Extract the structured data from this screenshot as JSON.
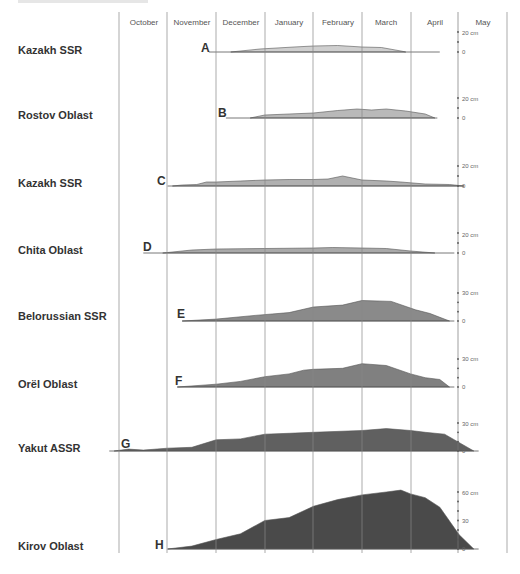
{
  "chart_data": {
    "type": "area",
    "title": "",
    "xlabel": "",
    "ylabel": "Snow depth",
    "months": [
      "October",
      "November",
      "December",
      "January",
      "February",
      "March",
      "April",
      "May"
    ],
    "axis_unit": "cm",
    "series": [
      {
        "id": "A",
        "region": "Kazakh SSR",
        "fill": "#cfcfcf",
        "scale_max": 20,
        "scale_label": "20 cm",
        "start_month_frac": 1.85,
        "end_month_frac": 6.6,
        "points": [
          [
            2.3,
            0
          ],
          [
            2.9,
            3
          ],
          [
            3.6,
            5
          ],
          [
            4.0,
            6
          ],
          [
            4.5,
            6.5
          ],
          [
            5.0,
            5
          ],
          [
            5.4,
            4.5
          ],
          [
            5.8,
            1
          ],
          [
            5.9,
            0
          ]
        ]
      },
      {
        "id": "B",
        "region": "Rostov Oblast",
        "fill": "#b9b9b9",
        "scale_max": 20,
        "scale_label": "20 cm",
        "start_month_frac": 2.2,
        "end_month_frac": 6.55,
        "points": [
          [
            2.7,
            0
          ],
          [
            3.0,
            3
          ],
          [
            3.5,
            4
          ],
          [
            4.0,
            5
          ],
          [
            4.5,
            7.5
          ],
          [
            4.9,
            9
          ],
          [
            5.2,
            8
          ],
          [
            5.5,
            9
          ],
          [
            5.9,
            7
          ],
          [
            6.3,
            4
          ],
          [
            6.5,
            0
          ]
        ]
      },
      {
        "id": "C",
        "region": "Kazakh SSR",
        "fill": "#b0b0b0",
        "scale_max": 20,
        "scale_label": "20 cm",
        "start_month_frac": 1.0,
        "end_month_frac": 7.1,
        "points": [
          [
            1.1,
            0
          ],
          [
            1.3,
            1
          ],
          [
            1.6,
            1.5
          ],
          [
            1.8,
            4
          ],
          [
            2.0,
            4
          ],
          [
            2.5,
            5
          ],
          [
            3.0,
            6
          ],
          [
            3.5,
            6.5
          ],
          [
            4.0,
            6.5
          ],
          [
            4.3,
            7
          ],
          [
            4.6,
            10
          ],
          [
            5.0,
            6
          ],
          [
            5.5,
            5
          ],
          [
            5.8,
            4
          ],
          [
            6.3,
            2
          ],
          [
            6.8,
            1.5
          ],
          [
            7.1,
            0
          ]
        ]
      },
      {
        "id": "D",
        "region": "Chita Oblast",
        "fill": "#a9a9a9",
        "scale_max": 20,
        "scale_label": "20 cm",
        "start_month_frac": 0.5,
        "end_month_frac": 6.9,
        "points": [
          [
            0.9,
            0
          ],
          [
            1.5,
            3
          ],
          [
            2.0,
            4
          ],
          [
            3.0,
            4.5
          ],
          [
            4.0,
            5
          ],
          [
            4.4,
            5.5
          ],
          [
            5.0,
            5
          ],
          [
            5.5,
            4.5
          ],
          [
            6.0,
            2
          ],
          [
            6.5,
            0
          ]
        ]
      },
      {
        "id": "E",
        "region": "Belorussian SSR",
        "fill": "#8a8a8a",
        "scale_max": 30,
        "scale_label": "30 cm",
        "start_month_frac": 1.3,
        "end_month_frac": 6.9,
        "points": [
          [
            1.3,
            0
          ],
          [
            2.0,
            2
          ],
          [
            2.8,
            6
          ],
          [
            3.5,
            9
          ],
          [
            4.0,
            15
          ],
          [
            4.6,
            17
          ],
          [
            5.0,
            22
          ],
          [
            5.6,
            21
          ],
          [
            6.1,
            12
          ],
          [
            6.4,
            8
          ],
          [
            6.6,
            4
          ],
          [
            6.8,
            0
          ]
        ]
      },
      {
        "id": "F",
        "region": "Orël Oblast",
        "fill": "#808080",
        "scale_max": 30,
        "scale_label": "30 cm",
        "start_month_frac": 1.2,
        "end_month_frac": 6.9,
        "points": [
          [
            1.2,
            0
          ],
          [
            2.0,
            3
          ],
          [
            2.5,
            6
          ],
          [
            3.0,
            11
          ],
          [
            3.5,
            14
          ],
          [
            3.8,
            18
          ],
          [
            4.0,
            19
          ],
          [
            4.6,
            20
          ],
          [
            5.0,
            25
          ],
          [
            5.5,
            23
          ],
          [
            6.0,
            14
          ],
          [
            6.3,
            10
          ],
          [
            6.6,
            8
          ],
          [
            6.8,
            0
          ]
        ]
      },
      {
        "id": "G",
        "region": "Yakut ASSR",
        "fill": "#606060",
        "scale_max": 30,
        "scale_label": "30 cm",
        "start_month_frac": -0.2,
        "end_month_frac": 7.4,
        "points": [
          [
            -0.1,
            0
          ],
          [
            0.2,
            2
          ],
          [
            0.5,
            1
          ],
          [
            1.0,
            3
          ],
          [
            1.5,
            4
          ],
          [
            2.0,
            12
          ],
          [
            2.5,
            13
          ],
          [
            3.0,
            18
          ],
          [
            3.5,
            19
          ],
          [
            4.0,
            20
          ],
          [
            5.0,
            22
          ],
          [
            5.5,
            24
          ],
          [
            6.0,
            22
          ],
          [
            6.3,
            20
          ],
          [
            6.7,
            18
          ],
          [
            7.3,
            0
          ]
        ]
      },
      {
        "id": "H",
        "region": "Kirov Oblast",
        "fill": "#4a4a4a",
        "scale_max": 60,
        "scale_label": "60 cm",
        "scale_mid_label": "30",
        "start_month_frac": 1.0,
        "end_month_frac": 7.4,
        "points": [
          [
            1.0,
            0
          ],
          [
            1.5,
            3
          ],
          [
            2.0,
            10
          ],
          [
            2.5,
            16
          ],
          [
            3.0,
            30
          ],
          [
            3.5,
            33
          ],
          [
            4.0,
            45
          ],
          [
            4.5,
            52
          ],
          [
            5.0,
            57
          ],
          [
            5.5,
            60
          ],
          [
            5.8,
            62
          ],
          [
            6.0,
            58
          ],
          [
            6.3,
            54
          ],
          [
            6.6,
            44
          ],
          [
            7.0,
            15
          ],
          [
            7.3,
            0
          ]
        ]
      }
    ]
  },
  "ui": {
    "months": [
      "October",
      "November",
      "December",
      "January",
      "February",
      "March",
      "April",
      "May"
    ],
    "regions": [
      "Kazakh SSR",
      "Rostov Oblast",
      "Kazakh SSR",
      "Chita Oblast",
      "Belorussian SSR",
      "Orël Oblast",
      "Yakut ASSR",
      "Kirov Oblast"
    ],
    "letters": [
      "A",
      "B",
      "C",
      "D",
      "E",
      "F",
      "G",
      "H"
    ],
    "axis_labels": {
      "A_top": "20 cm",
      "A_zero": "0",
      "B_top": "20 cm",
      "B_zero": "0",
      "C_top": "20 cm",
      "C_zero": "0",
      "D_top": "20 cm",
      "D_zero": "0",
      "E_top": "30 cm",
      "E_zero": "0",
      "F_top": "30 cm",
      "F_zero": "0",
      "G_top": "30 cm",
      "G_zero": "0",
      "H_top": "60 cm",
      "H_mid": "30",
      "H_zero": "0"
    }
  }
}
